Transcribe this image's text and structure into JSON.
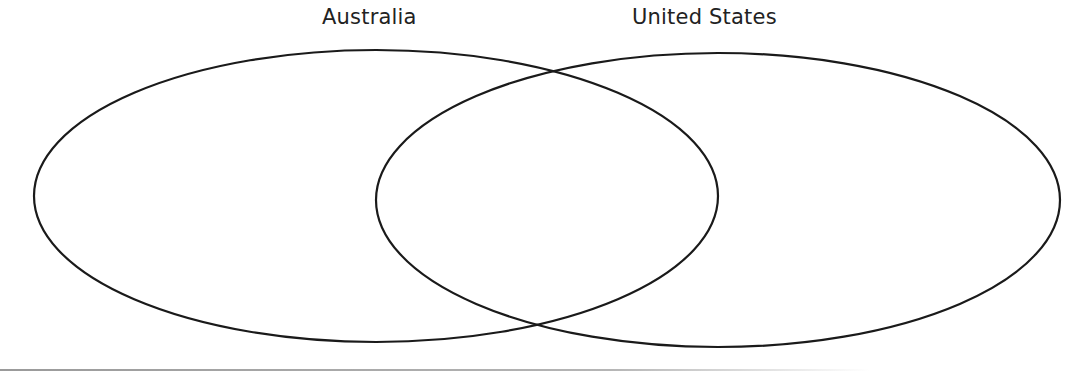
{
  "diagram": {
    "type": "venn",
    "sets": [
      {
        "id": "left",
        "label": "Australia",
        "ellipse": {
          "cx": 376,
          "cy": 196,
          "rx": 342,
          "ry": 146
        }
      },
      {
        "id": "right",
        "label": "United States",
        "ellipse": {
          "cx": 718,
          "cy": 200,
          "rx": 342,
          "ry": 147
        }
      }
    ],
    "regions": {
      "australia_only": "",
      "both": "",
      "united_states_only": ""
    },
    "stroke_color": "#1a1a1a",
    "label_color": "#222222",
    "background_color": "#ffffff"
  }
}
